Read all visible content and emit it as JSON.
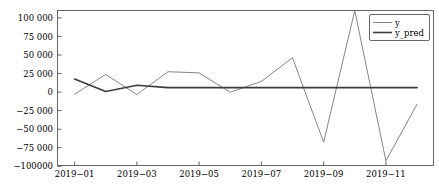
{
  "chart_data": {
    "type": "line",
    "title": "",
    "xlabel": "",
    "ylabel": "",
    "x": [
      "2019-01",
      "2019-02",
      "2019-03",
      "2019-04",
      "2019-05",
      "2019-06",
      "2019-07",
      "2019-08",
      "2019-09",
      "2019-10",
      "2019-11",
      "2019-12"
    ],
    "series": [
      {
        "name": "y",
        "color": "#777777",
        "values": [
          -8000,
          17500,
          -8500,
          21000,
          19500,
          -5500,
          8500,
          39000,
          -70000,
          100000,
          -94000,
          -21000
        ]
      },
      {
        "name": "y_pred",
        "color": "#3b3b3b",
        "values": [
          11500,
          -4500,
          3500,
          500,
          500,
          500,
          500,
          500,
          500,
          500,
          500,
          500
        ]
      }
    ],
    "ylim": [
      -100000,
      100000
    ],
    "yticks": [
      100000,
      75000,
      50000,
      25000,
      0,
      -25000,
      -50000,
      -75000,
      -100000
    ],
    "ytick_labels": [
      "100 000",
      "75 000",
      "50 000",
      "25 000",
      "0",
      "−25 000",
      "−50 000",
      "−75 000",
      "−100000"
    ],
    "xticks": [
      "2019-01",
      "2019-03",
      "2019-05",
      "2019-07",
      "2019-09",
      "2019-11"
    ],
    "xtick_labels": [
      "2019−01",
      "2019−03",
      "2019−05",
      "2019−07",
      "2019−09",
      "2019−11"
    ],
    "grid": false,
    "legend_position": "upper right",
    "legend_entries": [
      "y",
      "y_pred"
    ]
  },
  "legend": {
    "item_y": "y",
    "item_y_pred": "y_pred"
  },
  "axes": {
    "ytick_0": "100 000",
    "ytick_1": "75 000",
    "ytick_2": "50 000",
    "ytick_3": "25 000",
    "ytick_4": "0",
    "ytick_5": "−25 000",
    "ytick_6": "−50 000",
    "ytick_7": "−75 000",
    "ytick_8": "−100000",
    "xtick_0": "2019−01",
    "xtick_1": "2019−03",
    "xtick_2": "2019−05",
    "xtick_3": "2019−07",
    "xtick_4": "2019−09",
    "xtick_5": "2019−11"
  }
}
